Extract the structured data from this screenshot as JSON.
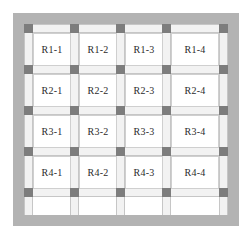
{
  "diagram": {
    "type": "floor-plan-grid",
    "grid": {
      "rows": 4,
      "columns": 4,
      "column_nodes_x": 5,
      "column_nodes_y": 5,
      "cell_pitch_x": 46,
      "cell_pitch_y": 41
    },
    "colors": {
      "background": "#ffffff",
      "perimeter_wall": "#b3b3b3",
      "column": "#7d7d7d",
      "beam": "#f2f2f2",
      "beam_outline": "#c6c6c6",
      "room_fill": "#ffffff",
      "room_outline": "#cfcfcf",
      "label_text": "#2b2b2b"
    },
    "rooms": [
      [
        {
          "label": "R1-1"
        },
        {
          "label": "R1-2"
        },
        {
          "label": "R1-3"
        },
        {
          "label": "R1-4"
        }
      ],
      [
        {
          "label": "R2-1"
        },
        {
          "label": "R2-2"
        },
        {
          "label": "R2-3"
        },
        {
          "label": "R2-4"
        }
      ],
      [
        {
          "label": "R3-1"
        },
        {
          "label": "R3-2"
        },
        {
          "label": "R3-3"
        },
        {
          "label": "R3-4"
        }
      ],
      [
        {
          "label": "R4-1"
        },
        {
          "label": "R4-2"
        },
        {
          "label": "R4-3"
        },
        {
          "label": "R4-4"
        }
      ]
    ]
  }
}
